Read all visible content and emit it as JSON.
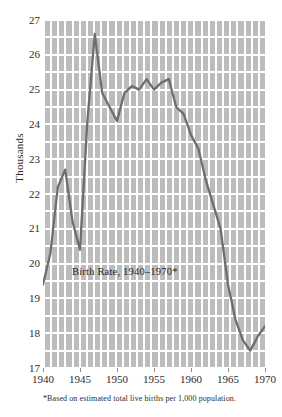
{
  "figure": {
    "inline_title": "Birth Rate, 1940–1970*",
    "footnote": "*Based on estimated total live births per 1,000 population.",
    "y_axis_label": "Thousands",
    "background_color": "#bcbcbc",
    "grid_color": "#ffffff",
    "line_color": "#6e6e6e",
    "text_color": "#2b2b2b"
  },
  "chart_data": {
    "type": "line",
    "title": "Birth Rate, 1940–1970*",
    "subtitle": "",
    "xlabel": "",
    "ylabel": "Thousands",
    "xlim": [
      1940,
      1970
    ],
    "ylim": [
      17,
      27
    ],
    "grid": true,
    "legend": "none",
    "x_ticks": [
      1940,
      1945,
      1950,
      1955,
      1960,
      1965,
      1970
    ],
    "y_ticks": [
      17,
      18,
      19,
      20,
      21,
      22,
      23,
      24,
      25,
      26,
      27
    ],
    "annotations": [
      {
        "text": "Birth Rate, 1940–1970*",
        "x": 1952.5,
        "y": 19.9
      },
      {
        "text": "*Based on estimated total live births per 1,000 population.",
        "x": 1940,
        "y": 16.4
      }
    ],
    "x": [
      1940,
      1941,
      1942,
      1943,
      1944,
      1945,
      1946,
      1947,
      1948,
      1949,
      1950,
      1951,
      1952,
      1953,
      1954,
      1955,
      1956,
      1957,
      1958,
      1959,
      1960,
      1961,
      1962,
      1963,
      1964,
      1965,
      1966,
      1967,
      1968,
      1969,
      1970
    ],
    "values": [
      19.4,
      20.3,
      22.2,
      22.7,
      21.2,
      20.4,
      24.1,
      26.6,
      24.9,
      24.5,
      24.1,
      24.9,
      25.1,
      25.0,
      25.3,
      25.0,
      25.2,
      25.3,
      24.5,
      24.3,
      23.7,
      23.3,
      22.4,
      21.7,
      21.0,
      19.4,
      18.4,
      17.8,
      17.5,
      17.9,
      18.2
    ]
  }
}
